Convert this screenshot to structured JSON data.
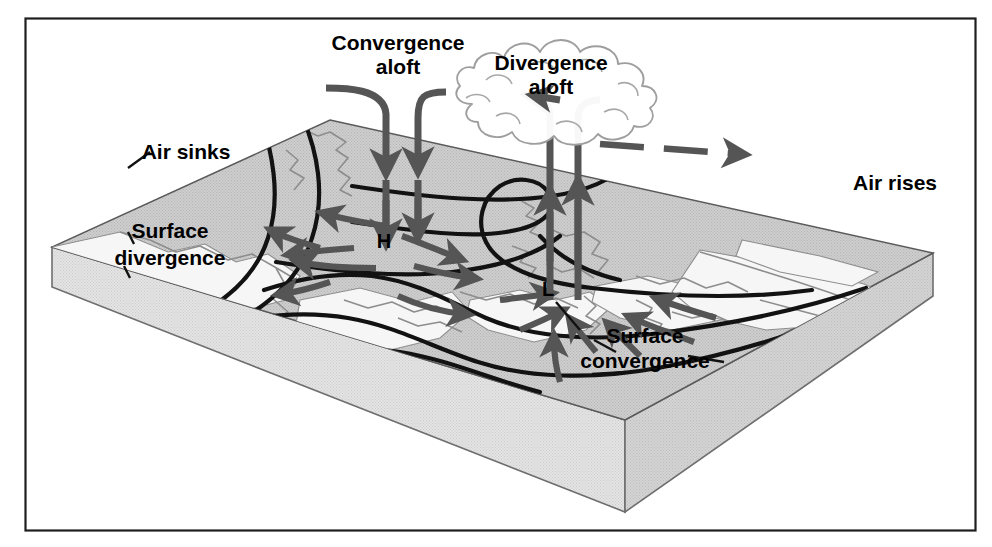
{
  "figure": {
    "title_visible": false,
    "kind": "three-dimensional block diagram of atmospheric circulation over a weather map",
    "frame": {
      "border_color": "#1a1a1a",
      "background": "#ffffff"
    }
  },
  "colors": {
    "map_surface": "#c9c9c9",
    "slab_top_edge": "#f2f2f2",
    "slab_front_face": "#cfcfcf",
    "slab_left_face": "#dcdcdc",
    "isobar_line": "#111111",
    "flow_arrow": "#555555",
    "cloud_outline": "#9a9a9a",
    "text": "#000000",
    "coastline": "#8a8a8a"
  },
  "labels": {
    "convergence_aloft": {
      "line1": "Convergence",
      "line2": "aloft"
    },
    "divergence_aloft": {
      "line1": "Divergence",
      "line2": "aloft"
    },
    "air_sinks": "Air sinks",
    "air_rises": "Air rises",
    "surface_divergence": {
      "line1": "Surface",
      "line2": "divergence"
    },
    "surface_convergence": {
      "line1": "Surface",
      "line2": "convergence"
    },
    "high_pressure": "H",
    "low_pressure": "L"
  },
  "elements": {
    "descending_arrows_count": 2,
    "ascending_arrows_count": 2,
    "divergence_outflow_arrows": 2,
    "upper_level_jet_arrow": "dashed-right-arrow",
    "cloud": "cumulonimbus-cloud",
    "isobars_count": 6
  },
  "annotations": [
    {
      "name": "convergence-aloft",
      "text": "Convergence aloft",
      "meaning": "air converging at upper levels above the surface high"
    },
    {
      "name": "divergence-aloft",
      "text": "Divergence aloft",
      "meaning": "air diverging at upper levels above the surface low"
    },
    {
      "name": "air-sinks",
      "text": "Air sinks",
      "meaning": "subsidence over the high-pressure center"
    },
    {
      "name": "air-rises",
      "text": "Air rises",
      "meaning": "ascent over the low-pressure center"
    },
    {
      "name": "surface-divergence",
      "text": "Surface divergence",
      "meaning": "outflow from the surface high"
    },
    {
      "name": "surface-convergence",
      "text": "Surface convergence",
      "meaning": "inflow toward the surface low"
    }
  ]
}
